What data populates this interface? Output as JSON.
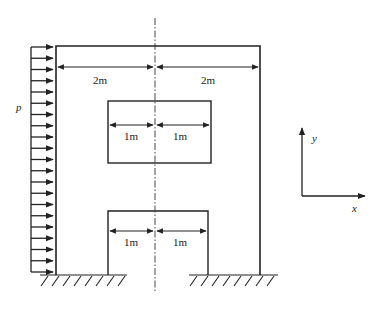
{
  "diagram": {
    "type": "structural-frame",
    "load": {
      "label": "p",
      "arrow_count": 21
    },
    "dimensions": {
      "outer_left": "2m",
      "outer_right": "2m",
      "inner_upper_left": "1m",
      "inner_upper_right": "1m",
      "inner_lower_left": "1m",
      "inner_lower_right": "1m"
    },
    "axes": {
      "x_label": "x",
      "y_label": "y"
    },
    "colors": {
      "line": "#222222",
      "background": "#ffffff"
    }
  }
}
